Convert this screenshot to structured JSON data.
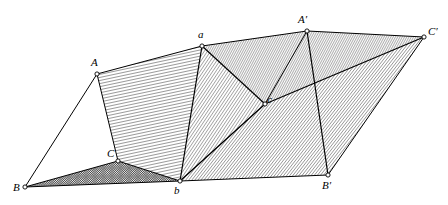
{
  "figure": {
    "width": 448,
    "height": 205,
    "background_color": "#ffffff",
    "line_color": "#000000",
    "hatch_color": "#1a1a1a"
  },
  "vertices": [
    {
      "id": "A",
      "label": "A",
      "x": 97,
      "y": 74,
      "label_x": 91,
      "label_y": 66,
      "marker": "open-circle"
    },
    {
      "id": "B",
      "label": "B",
      "x": 25,
      "y": 187,
      "label_x": 13,
      "label_y": 191,
      "marker": "open-circle"
    },
    {
      "id": "C",
      "label": "C",
      "x": 118,
      "y": 161,
      "label_x": 107,
      "label_y": 157,
      "marker": "open-circle"
    },
    {
      "id": "a",
      "label": "a",
      "x": 202,
      "y": 46,
      "label_x": 198,
      "label_y": 38,
      "marker": "open-circle"
    },
    {
      "id": "b",
      "label": "b",
      "x": 180,
      "y": 181,
      "label_x": 174,
      "label_y": 194,
      "marker": "open-circle"
    },
    {
      "id": "c",
      "label": "c",
      "x": 265,
      "y": 104,
      "label_x": 267,
      "label_y": 103,
      "marker": "open-circle"
    },
    {
      "id": "Ap",
      "label": "A′",
      "x": 307,
      "y": 31,
      "label_x": 298,
      "label_y": 23,
      "marker": "open-circle"
    },
    {
      "id": "Bp",
      "label": "B′",
      "x": 328,
      "y": 175,
      "label_x": 322,
      "label_y": 189,
      "marker": "open-circle"
    },
    {
      "id": "Cp",
      "label": "C′",
      "x": 424,
      "y": 37,
      "label_x": 428,
      "label_y": 35,
      "marker": "open-circle"
    }
  ],
  "edges": [
    {
      "name": "edge-B-A",
      "from": "B",
      "to": "A",
      "weight": 1.0
    },
    {
      "name": "edge-B-C",
      "from": "B",
      "to": "C",
      "weight": 1.0
    },
    {
      "name": "edge-A-C",
      "from": "A",
      "to": "C",
      "weight": 1.0
    },
    {
      "name": "edge-A-a",
      "from": "A",
      "to": "a",
      "weight": 1.0
    },
    {
      "name": "edge-C-b",
      "from": "C",
      "to": "b",
      "weight": 1.0
    },
    {
      "name": "edge-a-b",
      "from": "a",
      "to": "b",
      "weight": 1.2
    },
    {
      "name": "edge-a-c",
      "from": "a",
      "to": "c",
      "weight": 1.2
    },
    {
      "name": "edge-b-c",
      "from": "b",
      "to": "c",
      "weight": 1.4
    },
    {
      "name": "edge-B-b",
      "from": "B",
      "to": "b",
      "weight": 1.0
    },
    {
      "name": "edge-b-Bp",
      "from": "b",
      "to": "Bp",
      "weight": 1.0
    },
    {
      "name": "edge-a-Ap",
      "from": "a",
      "to": "Ap",
      "weight": 1.0
    },
    {
      "name": "edge-Ap-Cp",
      "from": "Ap",
      "to": "Cp",
      "weight": 1.0
    },
    {
      "name": "edge-Ap-Bp",
      "from": "Ap",
      "to": "Bp",
      "weight": 1.2
    },
    {
      "name": "edge-Bp-Cp",
      "from": "Bp",
      "to": "Cp",
      "weight": 1.0
    },
    {
      "name": "edge-c-Cp",
      "from": "c",
      "to": "Cp",
      "weight": 1.2
    },
    {
      "name": "edge-c-Ap",
      "from": "c",
      "to": "Ap",
      "weight": 1.0
    }
  ],
  "faces": [
    {
      "name": "face-A-a-b-C",
      "vertex_ids": [
        "A",
        "a",
        "b",
        "C"
      ],
      "hatch": "steep",
      "note": "near-vertical close ruling, upper-left panel"
    },
    {
      "name": "face-a-Ap-c",
      "vertex_ids": [
        "a",
        "Ap",
        "c"
      ],
      "hatch": "shallow-dense",
      "note": "upper-middle triangular panel, fine shallow ruling"
    },
    {
      "name": "face-Ap-Cp-c",
      "vertex_ids": [
        "Ap",
        "Cp",
        "c"
      ],
      "hatch": "shallow-dense",
      "note": "upper-right panel meeting at C-prime"
    },
    {
      "name": "face-c-Cp-Bp-b",
      "vertex_ids": [
        "c",
        "Cp",
        "Bp",
        "b"
      ],
      "hatch": "diagonal-dense",
      "note": "large lower-right panel, diagonal ruling"
    },
    {
      "name": "face-B-C-b",
      "vertex_ids": [
        "B",
        "C",
        "b"
      ],
      "hatch": "crosshatch",
      "note": "narrow dark wedge along the bottom edge from B to b"
    },
    {
      "name": "face-a-c-b",
      "vertex_ids": [
        "a",
        "c",
        "b"
      ],
      "hatch": "diagonal-medium",
      "note": "central triangle between the two ruled sheets"
    }
  ],
  "hatch_patterns": {
    "steep": {
      "angle_deg": 78,
      "spacing_px": 3.0,
      "stroke_width": 0.85
    },
    "shallow-dense": {
      "angle_deg": 28,
      "spacing_px": 2.0,
      "stroke_width": 0.7
    },
    "diagonal-dense": {
      "angle_deg": 38,
      "spacing_px": 2.4,
      "stroke_width": 0.7
    },
    "diagonal-medium": {
      "angle_deg": 34,
      "spacing_px": 2.6,
      "stroke_width": 0.7
    },
    "crosshatch": {
      "angle_deg": 45,
      "spacing_px": 1.6,
      "stroke_width": 0.8
    }
  }
}
